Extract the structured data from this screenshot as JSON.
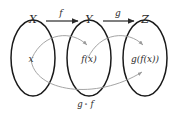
{
  "diagram": {
    "colors": {
      "background": "#ffffff",
      "oval_stroke": "#1a1a1a",
      "map_arrow": "#2a2a2a",
      "element_arrow": "#9a9a9a",
      "text": "#2b2b2b"
    },
    "sets": [
      {
        "label": "X",
        "element": "x"
      },
      {
        "label": "Y",
        "element": "f(x)"
      },
      {
        "label": "Z",
        "element": "g(f(x))"
      }
    ],
    "maps": [
      {
        "label": "f",
        "from": "X",
        "to": "Y"
      },
      {
        "label": "g",
        "from": "Y",
        "to": "Z"
      }
    ],
    "composition": {
      "label_left": "g",
      "operator": "∘",
      "label_right": "f",
      "from": "X",
      "to": "Z"
    }
  }
}
